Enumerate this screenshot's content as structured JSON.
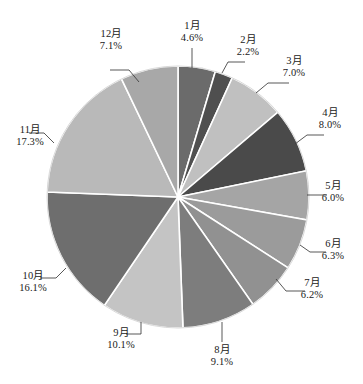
{
  "chart_data": {
    "type": "pie",
    "title": "",
    "xlabel": "",
    "ylabel": "",
    "legend_position": "none",
    "grid": false,
    "labels_format": "name + percent, outside with leader lines",
    "start_angle_deg": 90,
    "direction": "clockwise",
    "categories": [
      "1月",
      "2月",
      "3月",
      "4月",
      "5月",
      "6月",
      "7月",
      "8月",
      "9月",
      "10月",
      "11月",
      "12月"
    ],
    "values": [
      4.6,
      2.2,
      7.0,
      8.0,
      6.0,
      6.3,
      6.2,
      9.1,
      10.1,
      16.1,
      17.3,
      7.1
    ],
    "value_labels": [
      "4.6%",
      "2.2%",
      "7.0%",
      "8.0%",
      "6.0%",
      "6.3%",
      "6.2%",
      "9.1%",
      "10.1%",
      "16.1%",
      "17.3%",
      "7.1%"
    ],
    "unit": "%",
    "colors": [
      "#6b6b6b",
      "#4f4f4f",
      "#c0c0c0",
      "#4a4a4a",
      "#a5a5a5",
      "#9b9b9b",
      "#919191",
      "#7d7d7d",
      "#c4c4c4",
      "#6e6e6e",
      "#b9b9b9",
      "#a8a8a8"
    ],
    "slice_border_color": "#ffffff"
  },
  "slices": [
    {
      "name": "1月",
      "value": "4.6%",
      "color": "#6b6b6b"
    },
    {
      "name": "2月",
      "value": "2.2%",
      "color": "#4f4f4f"
    },
    {
      "name": "3月",
      "value": "7.0%",
      "color": "#c0c0c0"
    },
    {
      "name": "4月",
      "value": "8.0%",
      "color": "#4a4a4a"
    },
    {
      "name": "5月",
      "value": "6.0%",
      "color": "#a5a5a5"
    },
    {
      "name": "6月",
      "value": "6.3%",
      "color": "#9b9b9b"
    },
    {
      "name": "7月",
      "value": "6.2%",
      "color": "#919191"
    },
    {
      "name": "8月",
      "value": "9.1%",
      "color": "#7d7d7d"
    },
    {
      "name": "9月",
      "value": "10.1%",
      "color": "#c4c4c4"
    },
    {
      "name": "10月",
      "value": "16.1%",
      "color": "#6e6e6e"
    },
    {
      "name": "11月",
      "value": "17.3%",
      "color": "#b9b9b9"
    },
    {
      "name": "12月",
      "value": "7.1%",
      "color": "#a8a8a8"
    }
  ]
}
